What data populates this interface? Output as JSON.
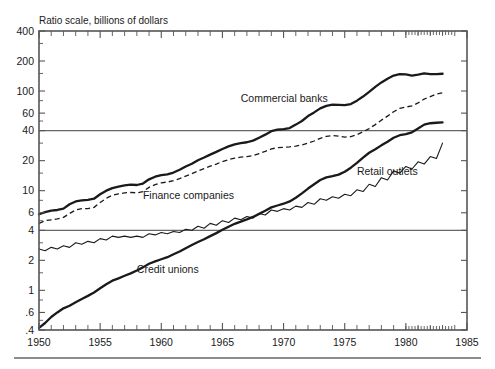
{
  "chart_data": {
    "type": "line",
    "title": "Ratio scale, billions of dollars",
    "xlabel": "",
    "ylabel": "",
    "scale": "log",
    "grid": "horizontal reference lines at 40 and 4",
    "legend_position": "inline annotations",
    "xlim": [
      1950,
      1985
    ],
    "ylim": [
      0.4,
      400
    ],
    "x_tick_labels": [
      "1950",
      "1955",
      "1960",
      "1965",
      "1970",
      "1975",
      "1980",
      "1985"
    ],
    "x_ticks": [
      1950,
      1955,
      1960,
      1965,
      1970,
      1975,
      1980,
      1985
    ],
    "y_tick_labels": [
      "400",
      "200",
      "100",
      "60",
      "40",
      "20",
      "10",
      "6",
      "4",
      "2",
      "1",
      ".6",
      ".4"
    ],
    "y_ticks": [
      400,
      200,
      100,
      60,
      40,
      20,
      10,
      6,
      4,
      2,
      1,
      0.6,
      0.4
    ],
    "gridline_values": [
      40,
      4
    ],
    "annotations": [
      {
        "text": "Commercial banks",
        "x": 1966.5,
        "y": 78
      },
      {
        "text": "Finance companies",
        "x": 1958.5,
        "y": 8.2
      },
      {
        "text": "Retail outlets",
        "x": 1976.0,
        "y": 14.5
      },
      {
        "text": "Credit unions",
        "x": 1958.0,
        "y": 1.5
      }
    ],
    "series": [
      {
        "name": "Commercial banks",
        "style": "thick-solid",
        "x": [
          1950,
          1950.5,
          1951,
          1951.5,
          1952,
          1952.5,
          1953,
          1953.5,
          1954,
          1954.5,
          1955,
          1955.5,
          1956,
          1956.5,
          1957,
          1957.5,
          1958,
          1958.5,
          1959,
          1959.5,
          1960,
          1960.5,
          1961,
          1961.5,
          1962,
          1962.5,
          1963,
          1963.5,
          1964,
          1964.5,
          1965,
          1965.5,
          1966,
          1966.5,
          1967,
          1967.5,
          1968,
          1968.5,
          1969,
          1969.5,
          1970,
          1970.5,
          1971,
          1971.5,
          1972,
          1972.5,
          1973,
          1973.5,
          1974,
          1974.5,
          1975,
          1975.5,
          1976,
          1976.5,
          1977,
          1977.5,
          1978,
          1978.5,
          1979,
          1979.5,
          1980,
          1980.5,
          1981,
          1981.5,
          1982,
          1982.5,
          1983
        ],
        "values": [
          5.8,
          6.1,
          6.3,
          6.4,
          6.6,
          7.3,
          7.8,
          8.0,
          8.1,
          8.3,
          9.2,
          10.0,
          10.6,
          11.0,
          11.3,
          11.5,
          11.4,
          11.8,
          13.0,
          13.8,
          14.3,
          14.6,
          15.2,
          16.2,
          17.5,
          18.6,
          20.2,
          21.5,
          23.0,
          24.5,
          26.2,
          27.8,
          29.2,
          30.0,
          30.6,
          31.8,
          34.0,
          36.5,
          39.5,
          41.0,
          41.5,
          42.5,
          46.0,
          50.0,
          56.0,
          61.0,
          67.0,
          71.0,
          73.0,
          72.5,
          72.0,
          74.0,
          80.0,
          88.0,
          98.0,
          110.0,
          122.0,
          133.0,
          143.0,
          148.0,
          147.0,
          143.0,
          146.0,
          150.0,
          148.0,
          148.0,
          149.0
        ]
      },
      {
        "name": "Finance companies",
        "style": "dashed",
        "x": [
          1950,
          1950.5,
          1951,
          1951.5,
          1952,
          1952.5,
          1953,
          1953.5,
          1954,
          1954.5,
          1955,
          1955.5,
          1956,
          1956.5,
          1957,
          1957.5,
          1958,
          1958.5,
          1959,
          1959.5,
          1960,
          1960.5,
          1961,
          1961.5,
          1962,
          1962.5,
          1963,
          1963.5,
          1964,
          1964.5,
          1965,
          1965.5,
          1966,
          1966.5,
          1967,
          1967.5,
          1968,
          1968.5,
          1969,
          1969.5,
          1970,
          1970.5,
          1971,
          1971.5,
          1972,
          1972.5,
          1973,
          1973.5,
          1974,
          1974.5,
          1975,
          1975.5,
          1976,
          1976.5,
          1977,
          1977.5,
          1978,
          1978.5,
          1979,
          1979.5,
          1980,
          1980.5,
          1981,
          1981.5,
          1982,
          1982.5,
          1983
        ],
        "values": [
          4.7,
          5.0,
          5.1,
          5.2,
          5.4,
          5.9,
          6.4,
          6.6,
          6.6,
          6.8,
          7.6,
          8.4,
          9.0,
          9.3,
          9.5,
          9.6,
          9.5,
          9.8,
          10.8,
          11.5,
          12.0,
          12.2,
          12.6,
          13.2,
          14.0,
          14.8,
          15.8,
          16.6,
          17.6,
          18.5,
          19.6,
          20.5,
          21.2,
          21.7,
          22.0,
          22.5,
          23.6,
          24.8,
          26.2,
          27.0,
          27.2,
          27.5,
          28.0,
          28.8,
          30.0,
          31.5,
          33.5,
          35.0,
          35.8,
          35.2,
          34.5,
          34.8,
          36.5,
          39.0,
          42.0,
          46.0,
          51.0,
          56.0,
          62.0,
          67.0,
          69.0,
          71.0,
          76.0,
          83.0,
          88.0,
          93.0,
          96.0
        ]
      },
      {
        "name": "Credit unions",
        "style": "thick-solid",
        "x": [
          1950,
          1950.5,
          1951,
          1951.5,
          1952,
          1952.5,
          1953,
          1953.5,
          1954,
          1954.5,
          1955,
          1955.5,
          1956,
          1956.5,
          1957,
          1957.5,
          1958,
          1958.5,
          1959,
          1959.5,
          1960,
          1960.5,
          1961,
          1961.5,
          1962,
          1962.5,
          1963,
          1963.5,
          1964,
          1964.5,
          1965,
          1965.5,
          1966,
          1966.5,
          1967,
          1967.5,
          1968,
          1968.5,
          1969,
          1969.5,
          1970,
          1970.5,
          1971,
          1971.5,
          1972,
          1972.5,
          1973,
          1973.5,
          1974,
          1974.5,
          1975,
          1975.5,
          1976,
          1976.5,
          1977,
          1977.5,
          1978,
          1978.5,
          1979,
          1979.5,
          1980,
          1980.5,
          1981,
          1981.5,
          1982,
          1982.5,
          1983
        ],
        "values": [
          0.42,
          0.47,
          0.54,
          0.6,
          0.66,
          0.7,
          0.76,
          0.82,
          0.88,
          0.95,
          1.05,
          1.15,
          1.25,
          1.32,
          1.4,
          1.48,
          1.58,
          1.7,
          1.85,
          1.95,
          2.05,
          2.15,
          2.3,
          2.45,
          2.65,
          2.85,
          3.05,
          3.25,
          3.5,
          3.75,
          4.05,
          4.35,
          4.65,
          4.9,
          5.15,
          5.45,
          5.85,
          6.3,
          6.8,
          7.1,
          7.4,
          7.8,
          8.5,
          9.4,
          10.5,
          11.6,
          12.8,
          13.6,
          14.0,
          14.5,
          15.5,
          17.0,
          19.0,
          21.5,
          24.0,
          26.0,
          28.5,
          31.0,
          34.0,
          36.0,
          37.0,
          38.5,
          42.0,
          46.0,
          47.5,
          48.0,
          48.5
        ]
      },
      {
        "name": "Retail outlets",
        "style": "thin-solid",
        "x": [
          1950,
          1950.5,
          1951,
          1951.5,
          1952,
          1952.5,
          1953,
          1953.5,
          1954,
          1954.5,
          1955,
          1955.5,
          1956,
          1956.5,
          1957,
          1957.5,
          1958,
          1958.5,
          1959,
          1959.5,
          1960,
          1960.5,
          1961,
          1961.5,
          1962,
          1962.5,
          1963,
          1963.5,
          1964,
          1964.5,
          1965,
          1965.5,
          1966,
          1966.5,
          1967,
          1967.5,
          1968,
          1968.5,
          1969,
          1969.5,
          1970,
          1970.5,
          1971,
          1971.5,
          1972,
          1972.5,
          1973,
          1973.5,
          1974,
          1974.5,
          1975,
          1975.5,
          1976,
          1976.5,
          1977,
          1977.5,
          1978,
          1978.5,
          1979,
          1979.5,
          1980,
          1980.5,
          1981,
          1981.5,
          1982,
          1982.5,
          1983
        ],
        "values": [
          2.6,
          2.5,
          2.7,
          2.6,
          2.8,
          2.7,
          3.0,
          2.9,
          3.1,
          3.0,
          3.3,
          3.2,
          3.5,
          3.4,
          3.5,
          3.4,
          3.5,
          3.4,
          3.7,
          3.6,
          3.8,
          3.7,
          3.9,
          3.8,
          4.1,
          4.0,
          4.4,
          4.2,
          4.7,
          4.5,
          5.0,
          4.8,
          5.3,
          5.1,
          5.5,
          5.3,
          5.9,
          5.7,
          6.4,
          6.2,
          6.6,
          6.4,
          7.0,
          6.8,
          7.6,
          7.3,
          8.3,
          8.0,
          8.7,
          8.4,
          9.2,
          8.9,
          10.2,
          9.8,
          11.6,
          11.0,
          13.5,
          12.8,
          15.8,
          15.0,
          17.5,
          16.5,
          19.5,
          18.5,
          22.0,
          21.0,
          30.0
        ]
      }
    ]
  },
  "figure": {
    "axis_title": "Ratio scale, billions of dollars"
  }
}
